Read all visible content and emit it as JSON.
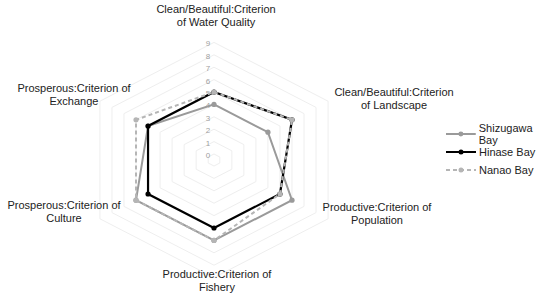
{
  "chart_data": {
    "type": "radar",
    "title": "",
    "axes": [
      "Clean/Beautiful:Criterion of Water Quality",
      "Clean/Beautiful:Criterion of Landscape",
      "Productive:Criterion of Population",
      "Productive:Criterion of Fishery",
      "Prosperous:Criterion of Culture",
      "Prosperous:Criterion of Exchange"
    ],
    "axis_labels": [
      {
        "line1": "Clean/Beautiful:Criterion",
        "line2": "of Water Quality"
      },
      {
        "line1": "Clean/Beautiful:Criterion",
        "line2": "of Landscape"
      },
      {
        "line1": "Productive:Criterion of",
        "line2": "Population"
      },
      {
        "line1": "Productive:Criterion of",
        "line2": "Fishery"
      },
      {
        "line1": "Prosperous:Criterion of",
        "line2": "Culture"
      },
      {
        "line1": "Prosperous:Criterion of",
        "line2": "Exchange"
      }
    ],
    "ticks": [
      "0",
      "1",
      "2",
      "3",
      "4",
      "5",
      "6",
      "7",
      "8",
      "9"
    ],
    "range": [
      0,
      9
    ],
    "grid": true,
    "legend_position": "right",
    "series": [
      {
        "name": "Shizugawa Bay",
        "values": [
          4,
          4,
          6,
          6,
          6,
          5
        ],
        "color": "#9a9a9a",
        "style": "solid"
      },
      {
        "name": "Hinase Bay",
        "values": [
          5,
          6,
          5,
          5,
          5,
          5
        ],
        "color": "#000000",
        "style": "solid"
      },
      {
        "name": "Nanao Bay",
        "values": [
          5,
          6,
          5,
          6,
          6,
          6
        ],
        "color": "#b5b5b5",
        "style": "dashed"
      }
    ]
  }
}
